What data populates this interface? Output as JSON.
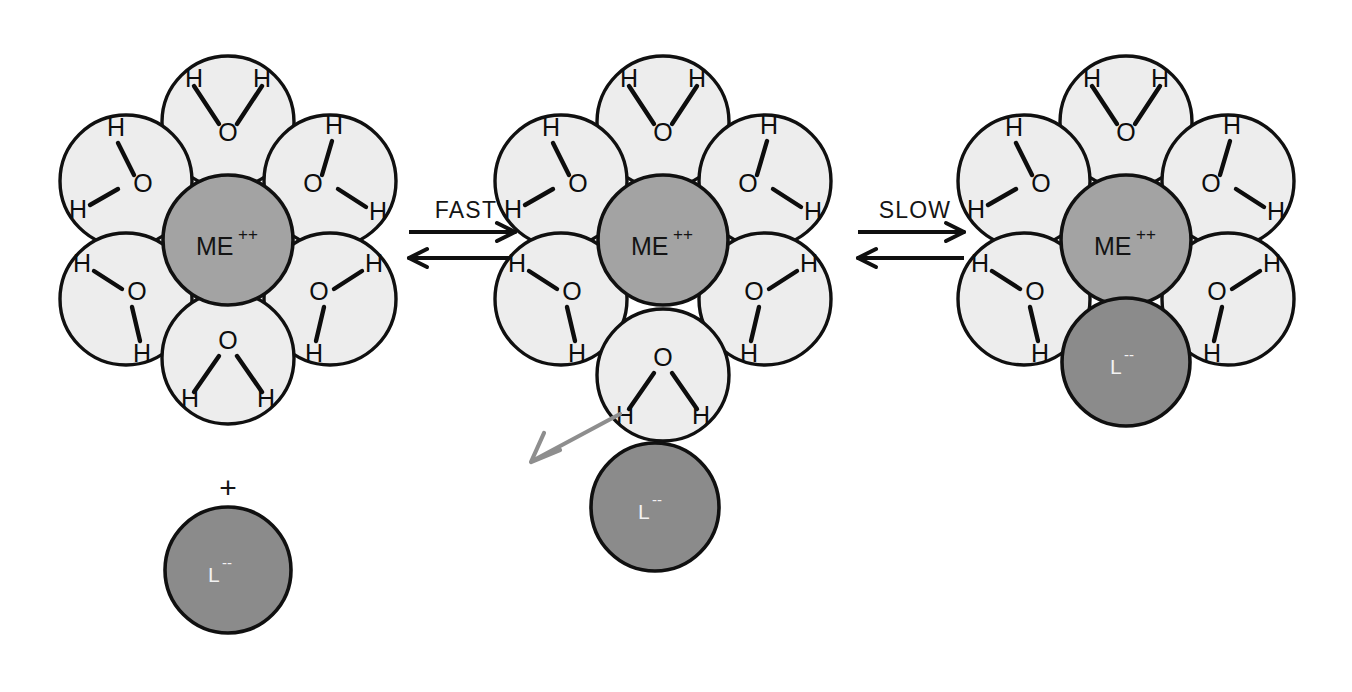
{
  "diagram": {
    "colors": {
      "background": "#ffffff",
      "water_fill": "#ededed",
      "water_stroke": "#101010",
      "metal_fill": "#a3a3a3",
      "metal_stroke": "#101010",
      "ligand_fill": "#8b8b8b",
      "ligand_stroke": "#101010",
      "bond": "#0d0d0d",
      "arrow": "#101010",
      "displacement_arrow": "#8e8e8e",
      "ligand_text": "#f2f2f2",
      "text": "#141414"
    },
    "labels": {
      "metal": "ME",
      "metal_charge": "++",
      "ligand": "L",
      "ligand_charge": "--",
      "oxygen": "O",
      "hydrogen": "H",
      "plus": "+"
    },
    "reaction_steps": [
      {
        "id": "fast",
        "label": "FAST",
        "direction": "equilibrium"
      },
      {
        "id": "slow",
        "label": "SLOW",
        "direction": "equilibrium"
      }
    ],
    "clusters": [
      {
        "id": "hexaaqua-complex",
        "name": "Hexaaqua metal complex",
        "center_label": "ME",
        "center_charge": "++",
        "water_count": 6,
        "bound_ligand": null,
        "free_ligand": {
          "label": "L",
          "charge": "--",
          "state": "unbound"
        }
      },
      {
        "id": "outer-sphere-complex",
        "name": "Outer-sphere complex with leaving water",
        "center_label": "ME",
        "center_charge": "++",
        "water_count": 6,
        "bound_ligand": null,
        "free_ligand": {
          "label": "L",
          "charge": "--",
          "state": "outer-sphere"
        },
        "displacement": {
          "note": "water leaving inner shell"
        }
      },
      {
        "id": "inner-sphere-complex",
        "name": "Inner-sphere substituted complex",
        "center_label": "ME",
        "center_charge": "++",
        "water_count": 5,
        "bound_ligand": {
          "label": "L",
          "charge": "--",
          "state": "bound"
        },
        "free_ligand": null
      }
    ]
  }
}
